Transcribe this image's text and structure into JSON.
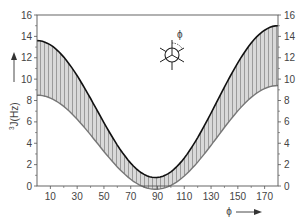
{
  "chart_data": {
    "type": "area",
    "title": "",
    "xlabel": "φ",
    "ylabel": "³J(Hz)",
    "xlim": [
      0,
      180
    ],
    "ylim": [
      0,
      16
    ],
    "x_ticks": [
      10,
      30,
      50,
      70,
      90,
      110,
      130,
      150,
      170
    ],
    "y_ticks": [
      0,
      2,
      4,
      6,
      8,
      10,
      12,
      14,
      16
    ],
    "y_ticks_right": [
      0,
      2,
      4,
      6,
      8,
      10,
      12,
      14,
      16
    ],
    "grid": false,
    "legend": null,
    "x": [
      0,
      10,
      20,
      30,
      40,
      50,
      60,
      70,
      80,
      90,
      100,
      110,
      120,
      130,
      140,
      150,
      160,
      170,
      180
    ],
    "series": [
      {
        "name": "upper bound",
        "color": "#111111",
        "model": {
          "A": 13.5,
          "B": -0.7,
          "C": 0.8
        },
        "values": [
          13.6,
          13.2,
          12.0,
          10.3,
          8.2,
          6.0,
          3.8,
          2.1,
          1.1,
          0.8,
          1.3,
          2.6,
          4.5,
          6.8,
          9.1,
          11.1,
          12.8,
          14.0,
          15.0
        ]
      },
      {
        "name": "lower bound",
        "color": "#777777",
        "model": {
          "A": 9.25,
          "B": -0.45,
          "C": -0.3
        },
        "values": [
          8.5,
          8.2,
          7.4,
          6.3,
          4.8,
          3.2,
          1.8,
          0.6,
          -0.1,
          -0.3,
          0.0,
          0.9,
          2.2,
          3.7,
          5.3,
          6.9,
          8.2,
          9.1,
          9.4
        ]
      }
    ],
    "fill_between": {
      "pattern": "vertical-hatch",
      "fill_color": "#d4d4d4",
      "hatch_color": "#8a8a8a"
    },
    "annotations": [
      {
        "type": "newman-projection-icon",
        "label": "ϕ",
        "position": "upper-middle"
      }
    ]
  },
  "labels": {
    "ylabel_prefix": "3",
    "ylabel_main": "J(Hz)",
    "xlabel": "ϕ",
    "newman_phi": "ϕ"
  }
}
